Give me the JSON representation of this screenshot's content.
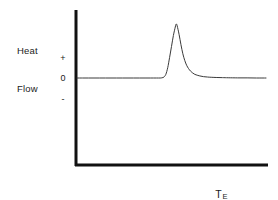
{
  "figure": {
    "background_color": "#ffffff",
    "axis_color": "#111111",
    "curve_color": "#3a3a3a"
  },
  "axes": {
    "y_title_line1": "Heat",
    "y_title_line2": "Flow",
    "x_title_symbol": "T",
    "x_title_subscript": "E",
    "y_tick_plus": "+",
    "y_tick_zero": "0",
    "y_tick_minus": "-"
  },
  "chart_data": {
    "type": "line",
    "title": "",
    "subtitle": "",
    "xlabel": "T_E",
    "ylabel": "Heat Flow",
    "grid": false,
    "legend": null,
    "axis_style": "open L-shaped spines (left and bottom only), no numeric scale",
    "xlim": [
      0,
      100
    ],
    "ylim": [
      -1,
      4.6
    ],
    "y_tick_values": [
      1,
      0,
      -0.6
    ],
    "y_tick_labels": [
      "+",
      "0",
      "-"
    ],
    "x_tick_labels": [],
    "annotations": [
      {
        "text": "exothermic crystallization peak",
        "x": 52,
        "y": 4.35
      }
    ],
    "series": [
      {
        "name": "Heat Flow",
        "x": [
          0,
          3,
          6,
          9,
          12,
          15,
          18,
          21,
          24,
          27,
          30,
          33,
          36,
          39,
          42,
          44,
          45,
          46,
          47,
          48,
          49,
          50,
          51,
          52,
          52.5,
          53,
          54,
          55,
          56,
          57,
          58,
          59,
          60,
          61,
          62,
          63,
          65,
          67,
          69,
          71,
          74,
          77,
          80,
          85,
          90,
          95,
          100
        ],
        "y": [
          0.0,
          0.0,
          0.0,
          0.0,
          0.0,
          0.0,
          0.0,
          0.0,
          0.0,
          0.0,
          0.0,
          0.0,
          0.0,
          0.0,
          0.0,
          0.0,
          0.02,
          0.08,
          0.3,
          0.85,
          1.7,
          2.6,
          3.5,
          4.2,
          4.45,
          4.3,
          3.6,
          2.75,
          2.0,
          1.45,
          1.05,
          0.78,
          0.58,
          0.44,
          0.33,
          0.26,
          0.17,
          0.11,
          0.08,
          0.06,
          0.04,
          0.03,
          0.02,
          0.01,
          0.01,
          0.0,
          0.0
        ]
      }
    ]
  }
}
